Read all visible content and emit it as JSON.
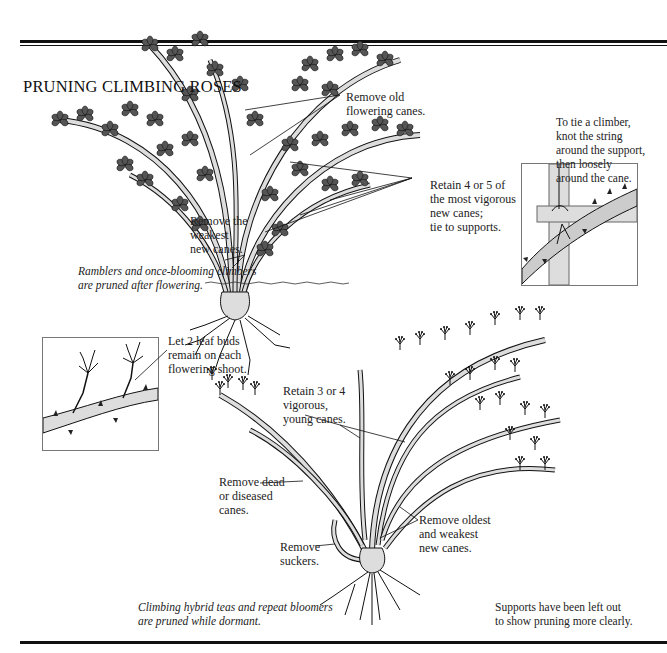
{
  "title": "PRUNING CLIMBING ROSES",
  "top_section": {
    "caption": "Ramblers and once-blooming climbers\nare pruned after flowering.",
    "labels": {
      "remove_old": "Remove old\nflowering canes.",
      "retain_4_5": "Retain 4 or 5 of\nthe most vigorous\nnew canes;\ntie to supports.",
      "remove_weakest": "Remove the\nweakest\nnew canes."
    },
    "tie_inset": {
      "text": "To tie a climber,\nknot the string\naround the support,\nthen loosely\naround the cane."
    }
  },
  "bottom_section": {
    "caption": "Climbing hybrid teas and repeat bloomers\nare pruned while dormant.",
    "note": "Supports have been left out\nto show pruning more clearly.",
    "labels": {
      "leaf_buds": "Let 2 leaf buds\nremain on each\nflowering shoot.",
      "retain_3_4": "Retain 3 or 4\nvigorous,\nyoung canes.",
      "remove_dead": "Remove dead\nor diseased\ncanes.",
      "remove_oldest": "Remove oldest\nand weakest\nnew canes.",
      "remove_suckers": "Remove\nsuckers."
    }
  },
  "colors": {
    "ink": "#111111",
    "cane_fill": "#d9d9d9",
    "background": "#ffffff"
  }
}
